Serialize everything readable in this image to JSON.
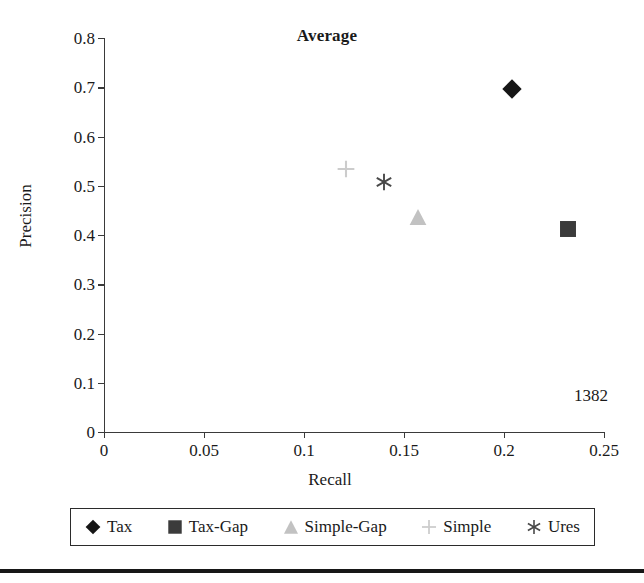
{
  "figure": {
    "page_number": "1382",
    "bottom_rule_color": "#171717"
  },
  "chart_data": {
    "type": "scatter",
    "title": "Average",
    "xlabel": "Recall",
    "ylabel": "Precision",
    "xlim": [
      0,
      0.25
    ],
    "ylim": [
      0,
      0.8
    ],
    "xticks": [
      "0",
      "0.05",
      "0.1",
      "0.15",
      "0.2",
      "0.25"
    ],
    "xtick_values": [
      0,
      0.05,
      0.1,
      0.15,
      0.2,
      0.25
    ],
    "yticks": [
      "0",
      "0.1",
      "0.2",
      "0.3",
      "0.4",
      "0.5",
      "0.6",
      "0.7",
      "0.8"
    ],
    "ytick_values": [
      0,
      0.1,
      0.2,
      0.3,
      0.4,
      0.5,
      0.6,
      0.7,
      0.8
    ],
    "grid": false,
    "legend_position": "bottom",
    "series": [
      {
        "name": "Tax",
        "marker": "diamond",
        "color": "#161616",
        "x": 0.204,
        "y": 0.697
      },
      {
        "name": "Tax-Gap",
        "marker": "square",
        "color": "#3b3b3b",
        "x": 0.232,
        "y": 0.412
      },
      {
        "name": "Simple-Gap",
        "marker": "triangle",
        "color": "#c2c2c2",
        "x": 0.157,
        "y": 0.437
      },
      {
        "name": "Simple",
        "marker": "plus",
        "color": "#cccccc",
        "x": 0.121,
        "y": 0.533
      },
      {
        "name": "Ures",
        "marker": "asterisk",
        "color": "#494949",
        "x": 0.14,
        "y": 0.508
      }
    ]
  }
}
